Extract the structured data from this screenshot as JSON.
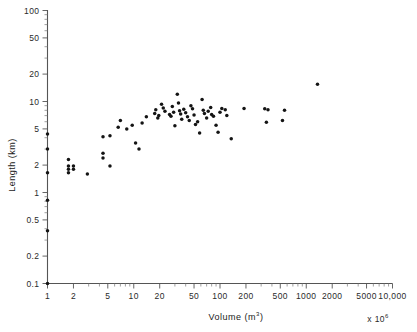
{
  "figure": {
    "name": "length-volume-scatter",
    "xlabel_main": "Volume",
    "xlabel_units": "(m",
    "xlabel_units_sup": "3",
    "xlabel_units_close": ")",
    "ylabel": "Length (km)",
    "multiplier_prefix": "x 10",
    "multiplier_exponent": "6",
    "marker_color": "#141414",
    "axis_color": "#555555"
  },
  "chart_data": {
    "type": "scatter",
    "title": "",
    "xlabel": "Volume (m3)  x 10^6",
    "ylabel": "Length (km)",
    "xscale": "log",
    "yscale": "log",
    "xlim": [
      1,
      10000
    ],
    "ylim": [
      0.1,
      100
    ],
    "grid": false,
    "legend": null,
    "xticks": [
      1,
      2,
      5,
      10,
      20,
      50,
      100,
      200,
      500,
      1000,
      2000,
      5000,
      10000
    ],
    "xticklabels": [
      "1",
      "2",
      "5",
      "10",
      "20",
      "50",
      "100",
      "200",
      "500",
      "1000",
      "2000",
      "5000",
      "10,000"
    ],
    "yticks": [
      0.1,
      0.2,
      0.5,
      1,
      2,
      5,
      10,
      20,
      50,
      100
    ],
    "yticklabels": [
      "0.1",
      "0.2",
      "0.5",
      "1",
      "2",
      "5",
      "10",
      "20",
      "50",
      "100"
    ],
    "series": [
      {
        "name": "deposits",
        "marker": "circle",
        "x": [
          1.0,
          1.0,
          1.0,
          1.0,
          1.0,
          1.0,
          1.75,
          1.75,
          1.75,
          1.75,
          2.0,
          2.0,
          2.9,
          4.4,
          4.4,
          4.4,
          5.3,
          5.3,
          6.6,
          7.0,
          8.3,
          9.6,
          10.5,
          11.5,
          12.5,
          14.0,
          17.5,
          18.0,
          19.0,
          19.5,
          21.0,
          22.0,
          23.0,
          26.0,
          27.0,
          28.0,
          29.0,
          30.0,
          32.0,
          33.0,
          34.0,
          35.0,
          36.0,
          38.0,
          40.0,
          42.0,
          44.0,
          46.0,
          48.0,
          50.0,
          52.0,
          55.0,
          58.0,
          62.0,
          64.0,
          66.0,
          70.0,
          73.0,
          78.0,
          80.0,
          84.0,
          90.0,
          95.0,
          100.0,
          105.0,
          115.0,
          120.0,
          135.0,
          190.0,
          330.0,
          360.0,
          345.0,
          530.0,
          560.0,
          1350.0
        ],
        "y": [
          4.4,
          3.0,
          1.65,
          0.82,
          0.38,
          0.1,
          2.3,
          1.95,
          1.8,
          1.65,
          1.95,
          1.8,
          1.6,
          4.1,
          2.7,
          2.4,
          4.2,
          1.95,
          5.2,
          6.2,
          5.0,
          5.5,
          3.5,
          3.0,
          5.8,
          6.8,
          7.4,
          8.1,
          6.6,
          7.0,
          9.3,
          8.5,
          7.8,
          7.2,
          6.9,
          8.8,
          7.6,
          5.4,
          12.0,
          9.6,
          7.9,
          7.3,
          6.4,
          8.2,
          7.5,
          6.8,
          6.2,
          9.0,
          8.3,
          7.1,
          5.6,
          6.0,
          4.5,
          10.5,
          8.0,
          7.4,
          6.6,
          7.8,
          8.6,
          7.2,
          6.9,
          5.5,
          4.6,
          7.6,
          8.4,
          8.1,
          7.0,
          3.9,
          8.4,
          8.3,
          8.1,
          5.9,
          6.2,
          8.0,
          15.5
        ]
      }
    ]
  }
}
